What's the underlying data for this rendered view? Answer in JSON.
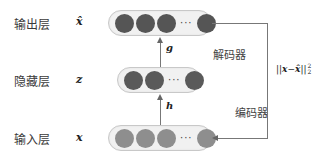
{
  "diagram": {
    "colors": {
      "output_node": "#555555",
      "hidden_node": "#5a5a5a",
      "input_node": "#8e8e8e",
      "pill_bg": "#f1f1f1",
      "line": "#777777"
    },
    "layers": [
      {
        "id": "output",
        "label": "输出层",
        "var": "x̂",
        "nodes": 4,
        "ellipsis": "···"
      },
      {
        "id": "hidden",
        "label": "隐藏层",
        "var": "z",
        "nodes": 3,
        "ellipsis": "···"
      },
      {
        "id": "input",
        "label": "输入层",
        "var": "x",
        "nodes": 4,
        "ellipsis": "···"
      }
    ],
    "edges": [
      {
        "from": "input",
        "to": "hidden",
        "label": "h",
        "block": "编码器"
      },
      {
        "from": "hidden",
        "to": "output",
        "label": "g",
        "block": "解码器"
      }
    ],
    "loss": {
      "text": "||x−x̂||",
      "sub": "2",
      "sup": "2",
      "parts": {
        "open": "||",
        "x": "x",
        "minus": "−",
        "xhat": "x̂",
        "close": "||"
      }
    }
  }
}
